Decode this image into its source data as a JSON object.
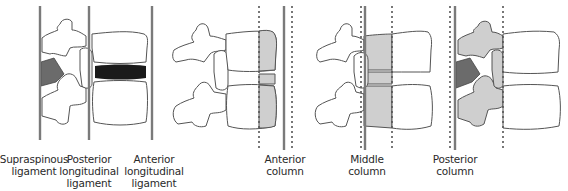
{
  "figure": {
    "panels": [
      {
        "id": "ligaments",
        "description": "Lateral view of two vertebrae showing spinal ligaments",
        "solid_lines_x": [
          40,
          89,
          152
        ],
        "dotted_lines_x": [],
        "highlight": "supraspinous and intervertebral disc (dark)"
      },
      {
        "id": "anterior-column",
        "solid_lines_x": [
          284
        ],
        "dotted_lines_x": [
          259,
          292
        ],
        "highlight": "anterior portion of vertebral body shaded"
      },
      {
        "id": "middle-column",
        "solid_lines_x": [
          365
        ],
        "dotted_lines_x": [
          361,
          392
        ],
        "highlight": "posterior portion of vertebral body shaded"
      },
      {
        "id": "posterior-column",
        "solid_lines_x": [
          455
        ],
        "dotted_lines_x": [
          450,
          503
        ],
        "highlight": "posterior elements shaded"
      }
    ],
    "colors": {
      "line": "#7a7a7a",
      "shade": "#cfcfcf",
      "disc": "#1a1a1a",
      "supraspinous": "#6b6b6b"
    }
  },
  "labels": {
    "supraspinous": "Supraspinous\nligament",
    "posterior_longitudinal": "Posterior\nlongitudinal\nligament",
    "anterior_longitudinal": "Anterior\nlongitudinal\nligament",
    "anterior_column": "Anterior\ncolumn",
    "middle_column": "Middle\ncolumn",
    "posterior_column": "Posterior\ncolumn"
  }
}
